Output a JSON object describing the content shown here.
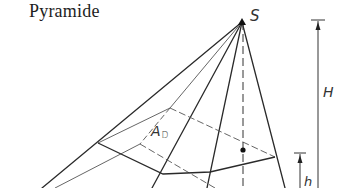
{
  "title": "Pyramide",
  "labels": {
    "apex": "S",
    "height_total": "H",
    "height_frustum": "h",
    "area_main": "A",
    "area_sub": "D"
  },
  "colors": {
    "line": "#2a2a2a",
    "light_line": "#555555",
    "text": "#1e1e1e"
  }
}
